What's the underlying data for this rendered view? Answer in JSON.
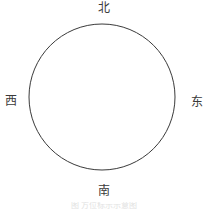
{
  "figure": {
    "type": "compass-rose",
    "background_color": "#ffffff",
    "caption": "图         方位标示示意图"
  },
  "circle": {
    "name": "horizon-circle",
    "center_x": 102,
    "center_y": 97,
    "radius": 73,
    "stroke_color": "#3a3a3a",
    "stroke_width": 1,
    "fill": "none"
  },
  "directions": {
    "north": {
      "label": "北",
      "pinyin": "bei",
      "english": "North",
      "bearing_degrees": 0,
      "position": "top"
    },
    "east": {
      "label": "东",
      "pinyin": "dong",
      "english": "East",
      "bearing_degrees": 90,
      "position": "right"
    },
    "south": {
      "label": "南",
      "pinyin": "nan",
      "english": "South",
      "bearing_degrees": 180,
      "position": "bottom"
    },
    "west": {
      "label": "西",
      "pinyin": "xi",
      "english": "West",
      "bearing_degrees": 270,
      "position": "left"
    }
  },
  "colors": {
    "line": "#3a3a3a",
    "text": "#3a3a3a",
    "background": "#ffffff",
    "caption": "#e2e2e2"
  }
}
